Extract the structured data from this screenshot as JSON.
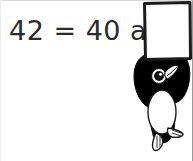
{
  "worksheet": {
    "equation_line": "42 = 40 and",
    "answer_blank": "",
    "text_color": "#2b2b2b",
    "background_color": "#ffffff"
  },
  "illustration": {
    "name": "penguin-holding-blank-sign",
    "description": "Cartoon penguin holding a blank rectangular sign overhead",
    "sign": {
      "label": "",
      "fill_color": "#ffffff",
      "stroke_color": "#1a1a1a"
    },
    "penguin": {
      "body_color": "#000000",
      "belly_color": "#ffffff",
      "beak_color": "#ffffff",
      "eye_color": "#000000",
      "foot_color": "#ffffff",
      "outline_color": "#1a1a1a"
    }
  }
}
